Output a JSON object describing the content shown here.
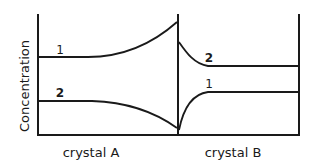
{
  "diagram": {
    "ylabel": "Concentration",
    "regions": [
      {
        "label": "crystal A"
      },
      {
        "label": "crystal B"
      }
    ],
    "curves": [
      {
        "id": "1",
        "label_A": "1",
        "label_B": "1",
        "description_A": "flat then rising toward interface",
        "description_B": "rises sharply from interface then flat (lower plateau)"
      },
      {
        "id": "2",
        "label_A": "2",
        "label_B": "2",
        "description_A": "flat then falling toward interface",
        "description_B": "drops sharply from interface then flat (upper plateau)"
      }
    ],
    "colors": {
      "line": "#1a1a1a",
      "background": "#ffffff"
    }
  }
}
